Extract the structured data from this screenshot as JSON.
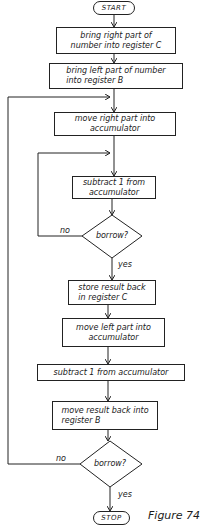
{
  "flowchart": {
    "start": "START",
    "stop": "STOP",
    "steps": [
      "bring right part of\nnumber into register C",
      "bring left part of number\ninto register B",
      "move right part into\naccumulator",
      "subtract 1 from\naccumulator",
      "store result back\nin register C",
      "move left part into\naccumulator",
      "subtract 1 from accumulator",
      "move result back into\nregister B"
    ],
    "decisions": [
      {
        "label": "borrow?",
        "no": "no",
        "yes": "yes"
      },
      {
        "label": "borrow?",
        "no": "no",
        "yes": "yes"
      }
    ]
  },
  "caption": "Figure 74"
}
